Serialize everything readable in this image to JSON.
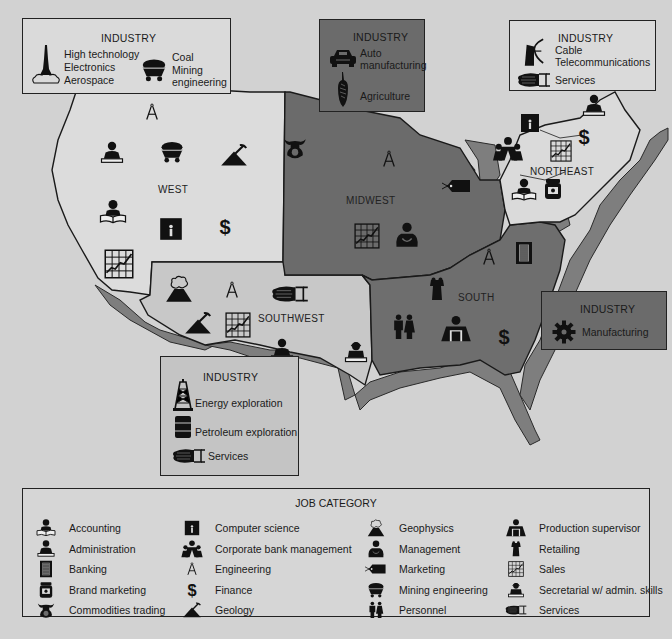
{
  "colors": {
    "background": "#d2d2d2",
    "west_fill": "#dcdcdc",
    "southwest_fill": "#c4c4c4",
    "midwest_fill": "#6b6b6b",
    "south_fill": "#6e6e6e",
    "northeast_fill": "#d8d8d8",
    "coast_relief": "#7a7a7a",
    "ink": "#1a1a1a"
  },
  "regions": {
    "west": {
      "label": "WEST",
      "icons": [
        "engineering",
        "administration",
        "mining-engineering",
        "geology",
        "accounting",
        "computer-science",
        "finance",
        "sales"
      ]
    },
    "midwest": {
      "label": "MIDWEST",
      "icons": [
        "commodities-trading",
        "engineering",
        "marketing",
        "sales",
        "management"
      ]
    },
    "northeast": {
      "label": "NORTHEAST",
      "icons": [
        "administration",
        "computer-science",
        "finance",
        "corporate-bank-management",
        "sales",
        "accounting",
        "brand-marketing"
      ]
    },
    "south": {
      "label": "SOUTH",
      "icons": [
        "engineering",
        "banking",
        "retailing",
        "personnel",
        "production-supervisor",
        "finance"
      ]
    },
    "southwest": {
      "label": "SOUTHWEST",
      "icons": [
        "geophysics",
        "engineering",
        "services",
        "geology",
        "sales",
        "administration",
        "secretarial"
      ]
    }
  },
  "industry_boxes": {
    "west": {
      "title": "INDUSTRY",
      "items": [
        "High technology",
        "Electronics",
        "Aerospace"
      ],
      "items2": [
        "Coal",
        "Mining",
        "engineering"
      ]
    },
    "midwest": {
      "title": "INDUSTRY",
      "items": [
        "Auto",
        "manufacturing",
        "Agriculture"
      ]
    },
    "northeast": {
      "title": "INDUSTRY",
      "items": [
        "Cable",
        "Telecommunications",
        "Services"
      ]
    },
    "south": {
      "title": "INDUSTRY",
      "items": [
        "Manufacturing"
      ]
    },
    "southwest": {
      "title": "INDUSTRY",
      "items": [
        "Energy exploration",
        "Petroleum exploration",
        "Services"
      ]
    }
  },
  "legend": {
    "title": "JOB CATEGORY",
    "columns": [
      [
        {
          "icon": "accounting-icon",
          "label": "Accounting"
        },
        {
          "icon": "administration-icon",
          "label": "Administration"
        },
        {
          "icon": "banking-icon",
          "label": "Banking"
        },
        {
          "icon": "brand-marketing-icon",
          "label": "Brand marketing"
        },
        {
          "icon": "commodities-trading-icon",
          "label": "Commodities trading"
        }
      ],
      [
        {
          "icon": "computer-science-icon",
          "label": "Computer science"
        },
        {
          "icon": "corporate-bank-management-icon",
          "label": "Corporate bank management"
        },
        {
          "icon": "engineering-icon",
          "label": "Engineering"
        },
        {
          "icon": "finance-icon",
          "label": "Finance"
        },
        {
          "icon": "geology-icon",
          "label": "Geology"
        }
      ],
      [
        {
          "icon": "geophysics-icon",
          "label": "Geophysics"
        },
        {
          "icon": "management-icon",
          "label": "Management"
        },
        {
          "icon": "marketing-icon",
          "label": "Marketing"
        },
        {
          "icon": "mining-engineering-icon",
          "label": "Mining engineering"
        },
        {
          "icon": "personnel-icon",
          "label": "Personnel"
        }
      ],
      [
        {
          "icon": "production-supervisor-icon",
          "label": "Production supervisor"
        },
        {
          "icon": "retailing-icon",
          "label": "Retailing"
        },
        {
          "icon": "sales-icon",
          "label": "Sales"
        },
        {
          "icon": "secretarial-icon",
          "label": "Secretarial w/ admin. skills"
        },
        {
          "icon": "services-icon",
          "label": "Services"
        }
      ]
    ]
  }
}
